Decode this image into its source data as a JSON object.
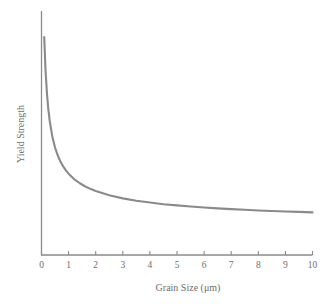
{
  "chart_data": {
    "type": "line",
    "title": "",
    "subtitle": "",
    "xlabel": "Grain Size (μm)",
    "ylabel": "Yield Strength",
    "xlim": [
      0,
      10
    ],
    "ylim": [
      0,
      1
    ],
    "xticks": [
      "0",
      "1",
      "2",
      "3",
      "4",
      "5",
      "6",
      "7",
      "8",
      "9",
      "10"
    ],
    "xtick_values": [
      0,
      1,
      2,
      3,
      4,
      5,
      6,
      7,
      8,
      9,
      10
    ],
    "yticks": [],
    "grid": false,
    "legend": null,
    "annotations": [],
    "series": [
      {
        "name": "Hall-Petch yield strength",
        "x": [
          0.1,
          0.15,
          0.2,
          0.25,
          0.3,
          0.4,
          0.5,
          0.6,
          0.7,
          0.8,
          0.9,
          1.0,
          1.2,
          1.4,
          1.6,
          1.8,
          2.0,
          2.5,
          3.0,
          3.5,
          4.0,
          4.5,
          5.0,
          5.5,
          6.0,
          6.5,
          7.0,
          7.5,
          8.0,
          8.5,
          9.0,
          9.5,
          10.0
        ],
        "y": [
          0.935,
          0.79,
          0.695,
          0.628,
          0.578,
          0.508,
          0.461,
          0.427,
          0.401,
          0.38,
          0.363,
          0.349,
          0.326,
          0.309,
          0.295,
          0.284,
          0.275,
          0.256,
          0.243,
          0.233,
          0.225,
          0.218,
          0.213,
          0.208,
          0.204,
          0.2,
          0.197,
          0.194,
          0.191,
          0.189,
          0.187,
          0.185,
          0.183
        ]
      }
    ]
  },
  "style": {
    "curve_color": "#8a8a8a",
    "axis_color": "#8a8a8a",
    "label_color": "#6e6e6e",
    "background": "#ffffff"
  }
}
